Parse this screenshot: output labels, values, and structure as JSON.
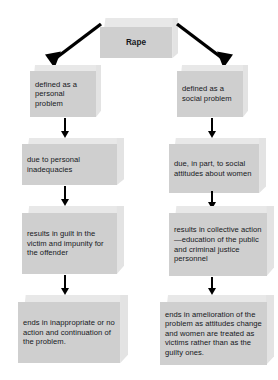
{
  "diagram": {
    "type": "flowchart",
    "title": "Rape",
    "orientation": "top-down, two branches",
    "root": {
      "label": "Rape"
    },
    "branches": [
      {
        "name": "personal-problem-branch",
        "side": "left",
        "steps": [
          {
            "label": "defined as a personal problem"
          },
          {
            "label": "due to personal inadequacies"
          },
          {
            "label": "results in guilt in the victim and impunity for the offender"
          },
          {
            "label": "ends in inappropriate or no action and continuation of the problem."
          }
        ]
      },
      {
        "name": "social-problem-branch",
        "side": "right",
        "steps": [
          {
            "label": "defined as a social problem"
          },
          {
            "label": "due, in part, to social attitudes about women"
          },
          {
            "label": "results in collective action—education of the public and criminal justice personnel"
          },
          {
            "label": "ends in amelioration of the problem as attitudes change and women are treated as victims rather than as the guilty ones."
          }
        ]
      }
    ],
    "connectors": [
      {
        "name": "root-to-left",
        "kind": "diagonal-arrow",
        "direction": "down-left"
      },
      {
        "name": "root-to-right",
        "kind": "diagonal-arrow",
        "direction": "down-right"
      },
      {
        "name": "left-1-to-2",
        "kind": "vertical-arrow",
        "direction": "down"
      },
      {
        "name": "left-2-to-3",
        "kind": "vertical-arrow",
        "direction": "down"
      },
      {
        "name": "left-3-to-4",
        "kind": "vertical-arrow",
        "direction": "down"
      },
      {
        "name": "right-1-to-2",
        "kind": "vertical-arrow",
        "direction": "down"
      },
      {
        "name": "right-2-to-3",
        "kind": "vertical-arrow",
        "direction": "down"
      },
      {
        "name": "right-3-to-4",
        "kind": "vertical-arrow",
        "direction": "down"
      }
    ],
    "colors": {
      "box_face": "#cfcfcf",
      "box_top_bevel": "#e8e8e8",
      "box_side_bevel": "#e3e3e3",
      "arrow": "#000000",
      "text": "#16181c",
      "background": "#ffffff"
    }
  }
}
